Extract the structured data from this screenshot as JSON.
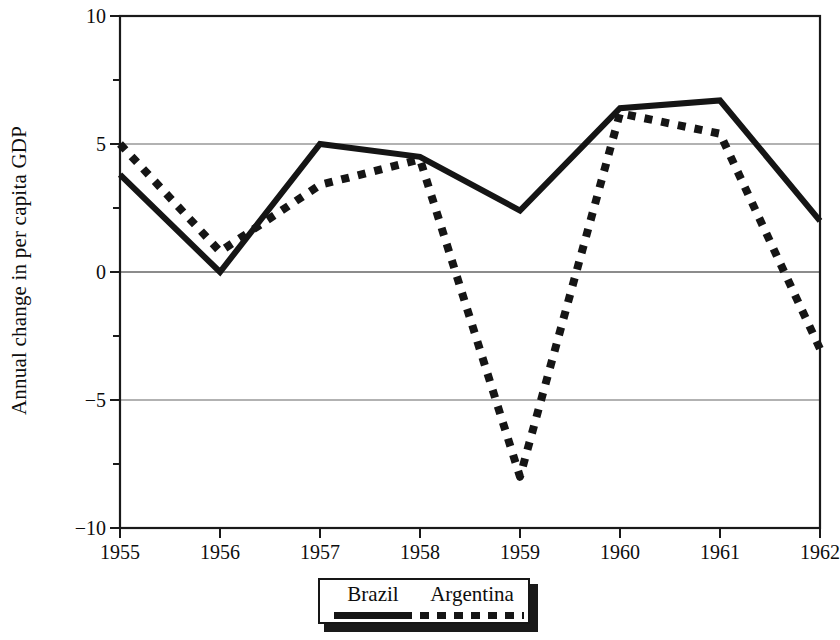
{
  "chart_data": {
    "type": "line",
    "title": "",
    "xlabel": "",
    "ylabel": "Annual change in per capita GDP",
    "x": [
      1955,
      1956,
      1957,
      1958,
      1959,
      1960,
      1961,
      1962
    ],
    "xtick_labels": [
      "1955",
      "1956",
      "1957",
      "1958",
      "1959",
      "1960",
      "1961",
      "1962"
    ],
    "ytick_labels": [
      "10",
      "5",
      "0",
      "−5",
      "−10"
    ],
    "yticks": [
      10,
      5,
      0,
      -5,
      -10
    ],
    "yminor_ticks": [
      7.5,
      2.5,
      -2.5,
      -7.5
    ],
    "ylim": [
      -10,
      10
    ],
    "xlim": [
      1955,
      1962
    ],
    "grid": "horizontal-at-major-yticks",
    "legend_position": "below-axes-center",
    "series": [
      {
        "name": "Brazil",
        "style": "solid",
        "color": "#151515",
        "values": [
          3.8,
          0.0,
          5.0,
          4.5,
          2.4,
          6.4,
          6.7,
          2.0
        ]
      },
      {
        "name": "Argentina",
        "style": "dotted",
        "color": "#151515",
        "values": [
          5.0,
          0.8,
          3.4,
          4.4,
          -8.0,
          6.2,
          5.4,
          -3.0
        ]
      }
    ]
  },
  "legend": {
    "entries": [
      {
        "label": "Brazil",
        "style": "solid"
      },
      {
        "label": "Argentina",
        "style": "dotted"
      }
    ]
  },
  "axes": {
    "frame_color": "#1a1a1a",
    "grid_color": "#666666"
  }
}
